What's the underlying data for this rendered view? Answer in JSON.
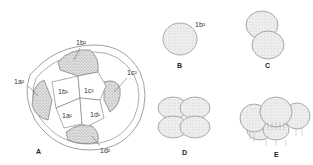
{
  "figure": {
    "panels": [
      {
        "id": "A",
        "caption": "A",
        "labels": [
          "1b²",
          "1a²",
          "1b¹",
          "1c¹",
          "1c²",
          "1a¹",
          "1d¹",
          "1d²"
        ]
      },
      {
        "id": "B",
        "caption": "B",
        "labels": [
          "1b²"
        ]
      },
      {
        "id": "C",
        "caption": "C",
        "labels": []
      },
      {
        "id": "D",
        "caption": "D",
        "labels": []
      },
      {
        "id": "E",
        "caption": "E",
        "labels": []
      }
    ],
    "labels": {
      "a_1b2": "1b²",
      "a_1a2": "1a²",
      "a_1b1": "1b¹",
      "a_1c1": "1c¹",
      "a_1c2": "1c²",
      "a_1a1": "1a¹",
      "a_1d1": "1d¹",
      "a_1d2": "1d²",
      "b_1b2": "1b²"
    },
    "captions": {
      "A": "A",
      "B": "B",
      "C": "C",
      "D": "D",
      "E": "E"
    },
    "colors": {
      "line": "#666666",
      "stipple": "#9a9a9a",
      "background": "#ffffff"
    }
  }
}
